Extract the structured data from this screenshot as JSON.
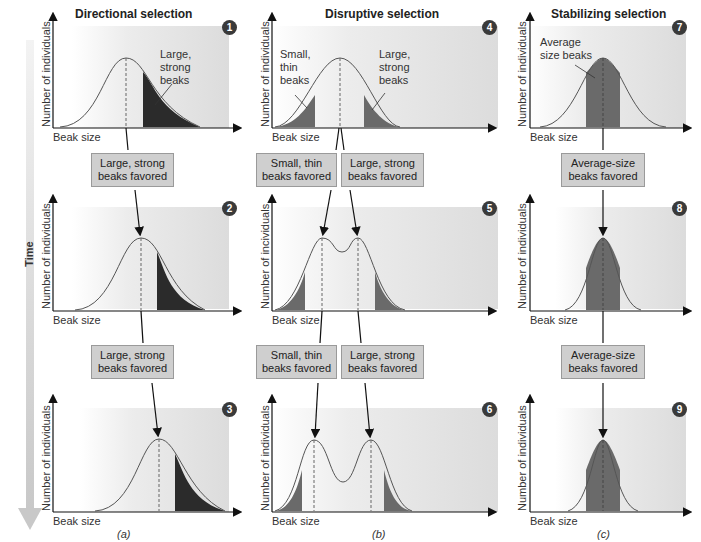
{
  "time_label": "Time",
  "x_axis_label": "Beak size",
  "y_axis_label": "Number of individuals",
  "y_axis_label_panel5": "Number of incividuals",
  "columns": [
    {
      "title": "Directional selection",
      "caption": "(a)",
      "panels": [
        {
          "number": "1",
          "annotation": "Large,\nstrong\nbeaks",
          "annotation_lines": [
            "Large,",
            "strong",
            "beaks"
          ]
        },
        {
          "number": "2"
        },
        {
          "number": "3"
        }
      ],
      "boxes": [
        {
          "line1": "Large, strong",
          "line2": "beaks favored"
        },
        {
          "line1": "Large, strong",
          "line2": "beaks favored"
        }
      ]
    },
    {
      "title": "Disruptive selection",
      "caption": "(b)",
      "panels": [
        {
          "number": "4",
          "annotation_left_lines": [
            "Small,",
            "thin",
            "beaks"
          ],
          "annotation_right_lines": [
            "Large,",
            "strong",
            "beaks"
          ]
        },
        {
          "number": "5"
        },
        {
          "number": "6"
        }
      ],
      "boxes": [
        {
          "line1": "Small, thin",
          "line2": "beaks favored"
        },
        {
          "line1": "Large, strong",
          "line2": "beaks favored"
        },
        {
          "line1": "Small, thin",
          "line2": "beaks favored"
        },
        {
          "line1": "Large, strong",
          "line2": "beaks favored"
        }
      ]
    },
    {
      "title": "Stabilizing selection",
      "caption": "(c)",
      "panels": [
        {
          "number": "7",
          "annotation_lines": [
            "Average",
            "size beaks"
          ]
        },
        {
          "number": "8"
        },
        {
          "number": "9"
        }
      ],
      "boxes": [
        {
          "line1": "Average-size",
          "line2": "beaks favored"
        },
        {
          "line1": "Average-size",
          "line2": "beaks favored"
        }
      ]
    }
  ],
  "colors": {
    "panel_bg": "#e6e6e6",
    "dark_fill": "#2b2b2b",
    "mid_fill": "#6a6a6a",
    "box_bg": "#cfcfcf",
    "badge": "#3a3a3a",
    "time_arrow": "#d8d8d8"
  }
}
